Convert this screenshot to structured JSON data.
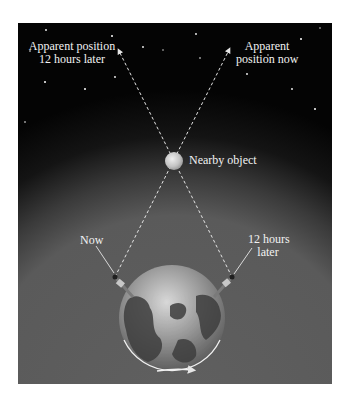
{
  "diagram": {
    "type": "parallax-illustration",
    "colors": {
      "sky_top": "#050505",
      "sky_glow": "#5a5a5a",
      "background_lower": "#5c5c5c",
      "line": "#e6e6e6",
      "label_text": "#f2f2f2",
      "object": "#c9c9c9",
      "page_background": "#ffffff"
    },
    "labels": {
      "top_left": [
        "Apparent position",
        "12 hours later"
      ],
      "top_right": [
        "Apparent",
        "position now"
      ],
      "object": "Nearby object",
      "observer_now": "Now",
      "observer_later": [
        "12 hours",
        "later"
      ]
    },
    "elements": {
      "nearby_object": {
        "x": 174,
        "y": 161,
        "r": 9
      },
      "earth": {
        "x": 172,
        "y": 318,
        "r": 53
      },
      "observer_now": {
        "x": 115,
        "y": 277
      },
      "observer_later": {
        "x": 232,
        "y": 277
      },
      "apparent_later": {
        "x": 117,
        "y": 47
      },
      "apparent_now": {
        "x": 231,
        "y": 46
      }
    },
    "rotation_arrow": "counterclockwise-viewed-from-top (arrow pointing right beneath Earth)"
  }
}
